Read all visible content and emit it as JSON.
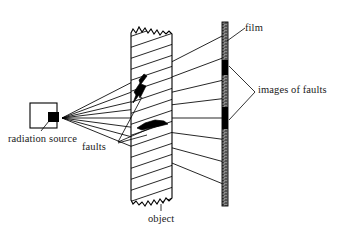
{
  "figure": {
    "background_color": "#ffffff",
    "ink_color": "#000000",
    "width": 352,
    "height": 244
  },
  "labels": {
    "radiation_source": "radiation source",
    "faults": "faults",
    "object": "object",
    "film": "film",
    "images_of_faults": "images of faults"
  },
  "components": {
    "source": {
      "name": "radiation-source",
      "box_x": 30,
      "box_y": 103,
      "box_w": 26,
      "box_h": 24,
      "emitter_x": 48,
      "emitter_y": 113,
      "emitter_w": 10,
      "emitter_h": 9,
      "apex_x": 62,
      "apex_y": 118
    },
    "object": {
      "name": "test-object",
      "left_x": 131,
      "right_x": 172,
      "top_y": 27,
      "bottom_y": 206,
      "hatch_angle_deg": 20,
      "hatch_spacing": 9,
      "edge_style": "torn-jagged"
    },
    "film": {
      "name": "film-strip",
      "x": 222,
      "top_y": 22,
      "bottom_y": 206,
      "width": 6,
      "texture": "grainy-gray",
      "bands": [
        {
          "name": "image-band-upper",
          "top_y": 60,
          "bottom_y": 74
        },
        {
          "name": "image-band-lower",
          "top_y": 108,
          "bottom_y": 128
        }
      ]
    },
    "faults": [
      {
        "name": "fault-crack-zigzag",
        "x": 138,
        "y": 82,
        "type": "zigzag-crack"
      },
      {
        "name": "fault-lens-horizontal",
        "x": 148,
        "y": 124,
        "type": "horizontal-lens"
      }
    ]
  },
  "rays": {
    "description": "Straight rays emitted from source apex through object onto film",
    "apex": [
      62,
      118
    ],
    "endpoints_on_film": [
      33,
      56,
      79,
      98,
      118,
      140,
      163,
      186
    ]
  },
  "leaders": {
    "radiation_source": {
      "from": [
        40,
        131
      ],
      "to": [
        48,
        120
      ]
    },
    "faults": [
      {
        "from": [
          117,
          143
        ],
        "to": [
          152,
          126
        ]
      },
      {
        "from": [
          117,
          145
        ],
        "to": [
          146,
          134
        ]
      },
      {
        "from": [
          117,
          144
        ],
        "to": [
          141,
          96
        ]
      }
    ],
    "images_of_faults": {
      "vertex": [
        256,
        92
      ],
      "to": [
        [
          228,
          67
        ],
        [
          228,
          119
        ]
      ]
    },
    "film": {
      "from": [
        244,
        27
      ],
      "to": [
        226,
        40
      ]
    },
    "object": {
      "from": [
        160,
        211
      ],
      "to": [
        160,
        207
      ]
    }
  }
}
